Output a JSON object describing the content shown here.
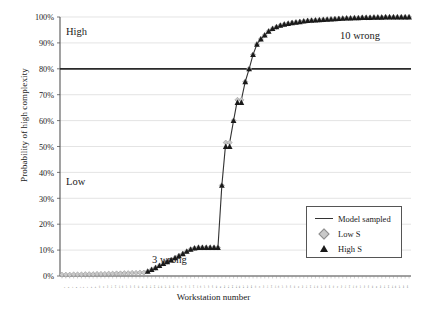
{
  "chart_data": {
    "type": "line",
    "title": "",
    "xlabel": "Workstation number",
    "ylabel": "Probability of high complexity",
    "ylim": [
      0,
      1
    ],
    "ytick_labels": [
      "0%",
      "10%",
      "20%",
      "30%",
      "40%",
      "50%",
      "60%",
      "70%",
      "80%",
      "90%",
      "100%"
    ],
    "ytick_values": [
      0,
      0.1,
      0.2,
      0.3,
      0.4,
      0.5,
      0.6,
      0.7,
      0.8,
      0.9,
      1.0
    ],
    "grid": "horizontal",
    "legend_position": "bottom-right",
    "threshold": {
      "label": "",
      "value": 0.8
    },
    "x": [
      1,
      2,
      3,
      4,
      5,
      6,
      7,
      8,
      9,
      10,
      11,
      12,
      13,
      14,
      15,
      16,
      17,
      18,
      19,
      20,
      21,
      22,
      23,
      24,
      25,
      26,
      27,
      28,
      29,
      30,
      31,
      32,
      33,
      34,
      35,
      36,
      37,
      38,
      39,
      40,
      41,
      42,
      43,
      44,
      45,
      46,
      47,
      48,
      49,
      50,
      51,
      52,
      53,
      54,
      55,
      56,
      57,
      58,
      59,
      60,
      61,
      62,
      63,
      64,
      65,
      66,
      67,
      68,
      69,
      70,
      71,
      72,
      73,
      74,
      75,
      76,
      77,
      78,
      79,
      80,
      81,
      82,
      83,
      84,
      85,
      86,
      87,
      88,
      89,
      90
    ],
    "xtick_labels": [
      "1",
      "2",
      "3",
      "4",
      "5",
      "6",
      "7",
      "8",
      "9",
      "10",
      "11",
      "12",
      "13",
      "14",
      "15",
      "16",
      "17",
      "18",
      "19",
      "20",
      "21",
      "22",
      "23",
      "24",
      "25",
      "26",
      "27",
      "28",
      "29",
      "30",
      "31",
      "32",
      "33",
      "34",
      "35",
      "36",
      "37",
      "38",
      "39",
      "40",
      "41",
      "42",
      "43",
      "44",
      "45",
      "46",
      "47",
      "48",
      "49",
      "50",
      "51",
      "52",
      "53",
      "54",
      "55",
      "56",
      "57",
      "58",
      "59",
      "60",
      "61",
      "62",
      "63",
      "64",
      "65",
      "66",
      "67",
      "68",
      "69",
      "70",
      "71",
      "72",
      "73",
      "74",
      "75",
      "76",
      "77",
      "78",
      "79",
      "80",
      "81",
      "82",
      "83",
      "84",
      "85",
      "86",
      "87",
      "88",
      "89",
      "90"
    ],
    "series": [
      {
        "name": "Model sampled",
        "marker": "line",
        "color": "#333333",
        "values": [
          0.005,
          0.005,
          0.005,
          0.006,
          0.006,
          0.006,
          0.007,
          0.007,
          0.007,
          0.008,
          0.008,
          0.008,
          0.009,
          0.009,
          0.01,
          0.01,
          0.011,
          0.011,
          0.012,
          0.012,
          0.013,
          0.013,
          0.018,
          0.025,
          0.032,
          0.04,
          0.048,
          0.055,
          0.062,
          0.07,
          0.078,
          0.086,
          0.095,
          0.103,
          0.108,
          0.11,
          0.11,
          0.11,
          0.11,
          0.11,
          0.11,
          0.35,
          0.515,
          0.515,
          0.6,
          0.68,
          0.68,
          0.75,
          0.8,
          0.855,
          0.895,
          0.915,
          0.93,
          0.945,
          0.955,
          0.962,
          0.968,
          0.972,
          0.975,
          0.978,
          0.98,
          0.982,
          0.984,
          0.986,
          0.987,
          0.988,
          0.989,
          0.99,
          0.991,
          0.992,
          0.993,
          0.994,
          0.995,
          0.996,
          0.996,
          0.997,
          0.997,
          0.998,
          0.998,
          0.998,
          0.999,
          0.999,
          0.999,
          1.0,
          1.0,
          1.0,
          1.0,
          1.0,
          1.0,
          1.0
        ]
      },
      {
        "name": "Low S",
        "marker": "diamond",
        "color": "#c9c9c9",
        "values": [
          0.005,
          0.005,
          0.005,
          0.006,
          0.006,
          0.006,
          0.007,
          0.007,
          0.007,
          0.008,
          0.008,
          0.008,
          0.009,
          0.009,
          0.01,
          0.01,
          0.011,
          0.011,
          0.012,
          0.012,
          0.013,
          0.013,
          0.018,
          0.025,
          0.032,
          0.04,
          0.048,
          0.055,
          0.062,
          0.07,
          0.078,
          0.086,
          0.095,
          0.103,
          0.108,
          0.11,
          0.11,
          0.11,
          0.11,
          0.11,
          0.11,
          0.35,
          0.515,
          0.515,
          0.6,
          0.68,
          0.68,
          0.75,
          0.8,
          0.855,
          0.895,
          0.915,
          0.93,
          0.945,
          0.955,
          0.962,
          0.968,
          0.972,
          0.975,
          0.978,
          0.98,
          0.982,
          0.984,
          0.986,
          0.987,
          0.988,
          0.989,
          0.99,
          0.991,
          0.992,
          0.993,
          0.994,
          0.995,
          0.996,
          0.996,
          0.997,
          0.997,
          0.998,
          0.998,
          0.998,
          0.999,
          0.999,
          0.999,
          1.0,
          1.0,
          1.0,
          1.0,
          1.0,
          1.0,
          1.0
        ]
      },
      {
        "name": "High S",
        "marker": "triangle",
        "color": "#1a1a1a",
        "values": [
          0.005,
          0.005,
          0.005,
          0.006,
          0.006,
          0.006,
          0.007,
          0.007,
          0.007,
          0.008,
          0.008,
          0.008,
          0.009,
          0.009,
          0.01,
          0.01,
          0.011,
          0.011,
          0.012,
          0.012,
          0.013,
          0.013,
          0.018,
          0.025,
          0.032,
          0.04,
          0.048,
          0.055,
          0.062,
          0.07,
          0.078,
          0.086,
          0.095,
          0.103,
          0.108,
          0.11,
          0.11,
          0.11,
          0.11,
          0.11,
          0.11,
          0.35,
          0.5,
          0.5,
          0.6,
          0.67,
          0.67,
          0.75,
          0.8,
          0.855,
          0.895,
          0.915,
          0.93,
          0.945,
          0.955,
          0.962,
          0.968,
          0.972,
          0.975,
          0.978,
          0.98,
          0.982,
          0.984,
          0.986,
          0.987,
          0.988,
          0.989,
          0.99,
          0.991,
          0.992,
          0.993,
          0.994,
          0.995,
          0.996,
          0.996,
          0.997,
          0.997,
          0.998,
          0.998,
          0.998,
          0.999,
          0.999,
          0.999,
          1.0,
          1.0,
          1.0,
          1.0,
          1.0,
          1.0,
          1.0
        ]
      }
    ],
    "annotations": [
      {
        "id": "high",
        "text": "High"
      },
      {
        "id": "low",
        "text": "Low"
      },
      {
        "id": "three-wrong",
        "text": "3 wrong"
      },
      {
        "id": "ten-wrong",
        "text": "10 wrong"
      }
    ],
    "legend_entries": [
      {
        "key": "line",
        "label": "Model sampled"
      },
      {
        "key": "diamond",
        "label": "Low S"
      },
      {
        "key": "triangle",
        "label": "High S"
      }
    ]
  }
}
